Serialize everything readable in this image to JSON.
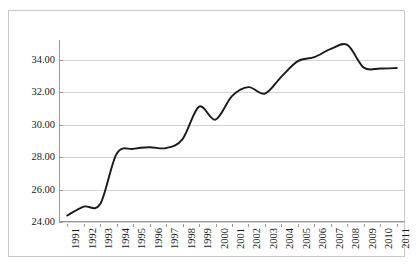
{
  "chart_data": {
    "type": "line",
    "title": "",
    "subtitle": "",
    "xlabel": "",
    "ylabel": "",
    "categories": [
      "1991",
      "1992",
      "1993",
      "1994",
      "1995",
      "1996",
      "1997",
      "1998",
      "1999",
      "2000",
      "2001",
      "2002",
      "2003",
      "2004",
      "2005",
      "2006",
      "2007",
      "2008",
      "2009",
      "2010",
      "2011"
    ],
    "values": [
      24.4,
      24.95,
      25.1,
      28.2,
      28.5,
      28.6,
      28.55,
      29.1,
      31.1,
      30.3,
      31.75,
      32.3,
      31.9,
      32.95,
      33.9,
      34.15,
      34.65,
      34.9,
      33.5,
      33.45,
      33.48
    ],
    "series": [
      {
        "name": "",
        "values": [
          24.4,
          24.95,
          25.1,
          28.2,
          28.5,
          28.6,
          28.55,
          29.1,
          31.1,
          30.3,
          31.75,
          32.3,
          31.9,
          32.95,
          33.9,
          34.15,
          34.65,
          34.9,
          33.5,
          33.45,
          33.48
        ]
      }
    ],
    "ylim": [
      24.0,
      35.2
    ],
    "yticks": [
      24.0,
      26.0,
      28.0,
      30.0,
      32.0,
      34.0
    ],
    "ytick_labels": [
      "24.00",
      "26.00",
      "28.00",
      "30.00",
      "32.00",
      "34.00"
    ],
    "grid": true,
    "legend": false,
    "legend_position": "none",
    "line_color": "#1a1a1a",
    "grid_color": "#d4d4d4",
    "axis_color": "#9a9a9a",
    "border_color": "#c8c8c8",
    "smoothing": "spline",
    "markers": false
  }
}
